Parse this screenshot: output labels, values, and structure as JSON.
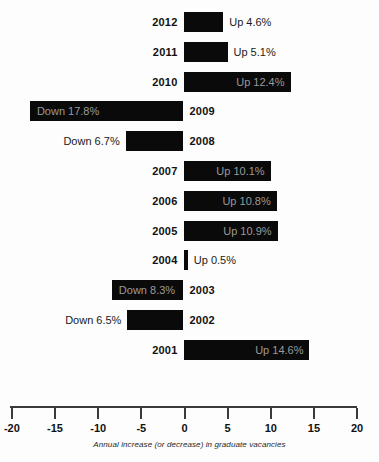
{
  "chart_data": {
    "type": "bar",
    "orientation": "horizontal",
    "title": "",
    "subtitle": "",
    "xlabel": "Annual increase (or decrease) in graduate vacancies",
    "ylabel": "",
    "xlim": [
      -20,
      20
    ],
    "xticks": [
      -20,
      -15,
      -10,
      -5,
      0,
      5,
      10,
      15,
      20
    ],
    "xtick_labels": [
      "-20",
      "-15",
      "-10",
      "-5",
      "0",
      "5",
      "10",
      "15",
      "20"
    ],
    "grid": false,
    "legend": null,
    "bar_color": "#0a0a0a",
    "inside_label_color": "#9a9a9a",
    "outside_label_color": "#1a1a1a",
    "categories": [
      "2012",
      "2011",
      "2010",
      "2009",
      "2008",
      "2007",
      "2006",
      "2005",
      "2004",
      "2003",
      "2002",
      "2001"
    ],
    "values": [
      4.6,
      5.1,
      12.4,
      -17.8,
      -6.7,
      10.1,
      10.8,
      10.9,
      0.5,
      -8.3,
      -6.5,
      14.6
    ],
    "data_labels": [
      "Up 4.6%",
      "Up 5.1%",
      "Up 12.4%",
      "Down 17.8%",
      "Down 6.7%",
      "Up 10.1%",
      "Up 10.8%",
      "Up 10.9%",
      "Up 0.5%",
      "Down 8.3%",
      "Down 6.5%",
      "Up 14.6%"
    ],
    "bars": [
      {
        "year": "2012",
        "value": 4.6,
        "label": "Up 4.6%",
        "direction": "up",
        "label_placement": "outside"
      },
      {
        "year": "2011",
        "value": 5.1,
        "label": "Up 5.1%",
        "direction": "up",
        "label_placement": "outside"
      },
      {
        "year": "2010",
        "value": 12.4,
        "label": "Up 12.4%",
        "direction": "up",
        "label_placement": "inside"
      },
      {
        "year": "2009",
        "value": -17.8,
        "label": "Down 17.8%",
        "direction": "down",
        "label_placement": "inside"
      },
      {
        "year": "2008",
        "value": -6.7,
        "label": "Down 6.7%",
        "direction": "down",
        "label_placement": "outside"
      },
      {
        "year": "2007",
        "value": 10.1,
        "label": "Up 10.1%",
        "direction": "up",
        "label_placement": "inside"
      },
      {
        "year": "2006",
        "value": 10.8,
        "label": "Up 10.8%",
        "direction": "up",
        "label_placement": "inside"
      },
      {
        "year": "2005",
        "value": 10.9,
        "label": "Up 10.9%",
        "direction": "up",
        "label_placement": "inside"
      },
      {
        "year": "2004",
        "value": 0.5,
        "label": "Up 0.5%",
        "direction": "up",
        "label_placement": "outside"
      },
      {
        "year": "2003",
        "value": -8.3,
        "label": "Down 8.3%",
        "direction": "down",
        "label_placement": "inside"
      },
      {
        "year": "2002",
        "value": -6.5,
        "label": "Down 6.5%",
        "direction": "down",
        "label_placement": "outside"
      },
      {
        "year": "2001",
        "value": 14.6,
        "label": "Up 14.6%",
        "direction": "up",
        "label_placement": "inside"
      }
    ]
  },
  "layout": {
    "zero_x": 183.5,
    "px_per_unit": 8.63,
    "first_row_top": 10,
    "row_step": 29.8,
    "bar_height": 20
  }
}
